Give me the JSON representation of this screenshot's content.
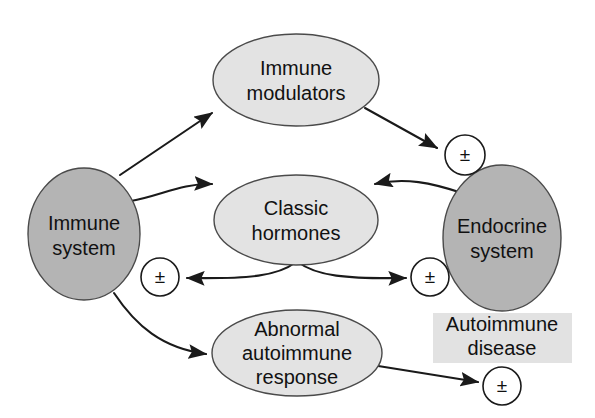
{
  "figure": {
    "type": "flow-diagram"
  },
  "colors": {
    "node_dark_gray": "#b4b4b4",
    "node_light_gray": "#e3e3e3",
    "box_gray": "#e2e2e2",
    "outline": "#4a4a4a",
    "arrow": "#1a1a1a",
    "text": "#111111",
    "background": "#ffffff"
  },
  "nodes": {
    "immune_system": {
      "label_line1": "Immune",
      "label_line2": "system",
      "shape": "ellipse",
      "fill": "#b4b4b4"
    },
    "immune_modulators": {
      "label_line1": "Immune",
      "label_line2": "modulators",
      "shape": "ellipse",
      "fill": "#e3e3e3"
    },
    "classic_hormones": {
      "label_line1": "Classic",
      "label_line2": "hormones",
      "shape": "ellipse",
      "fill": "#e3e3e3"
    },
    "endocrine_system": {
      "label_line1": "Endocrine",
      "label_line2": "system",
      "shape": "ellipse",
      "fill": "#b4b4b4"
    },
    "abnormal_autoimmune_response": {
      "label_line1": "Abnormal",
      "label_line2": "autoimmune",
      "label_line3": "response",
      "shape": "ellipse",
      "fill": "#e3e3e3"
    },
    "autoimmune_disease": {
      "label_line1": "Autoimmune",
      "label_line2": "disease",
      "shape": "rectangle",
      "fill": "#e2e2e2"
    }
  },
  "sign_markers": {
    "top_right": "±",
    "left_middle": "±",
    "right_middle": "±",
    "bottom_right": "±"
  },
  "edges": [
    {
      "id": "immune-system-to-immune-modulators",
      "from": "immune_system",
      "to": "immune_modulators",
      "style": "straight",
      "arrowheads": "end"
    },
    {
      "id": "immune-system-to-classic-hormones",
      "from": "immune_system",
      "to": "classic_hormones",
      "style": "curved",
      "arrowheads": "end"
    },
    {
      "id": "immune-modulators-to-sign-top-right",
      "from": "immune_modulators",
      "to": "sign_top_right",
      "style": "straight",
      "arrowheads": "end"
    },
    {
      "id": "endocrine-system-to-classic-hormones",
      "from": "endocrine_system",
      "to": "classic_hormones",
      "style": "curved",
      "arrowheads": "end"
    },
    {
      "id": "classic-hormones-to-sign-left-middle",
      "from": "classic_hormones",
      "to": "sign_left_middle",
      "style": "curved-fork",
      "arrowheads": "end"
    },
    {
      "id": "classic-hormones-to-sign-right-middle",
      "from": "classic_hormones",
      "to": "sign_right_middle",
      "style": "curved-fork",
      "arrowheads": "end"
    },
    {
      "id": "immune-system-to-abnormal-autoimmune-response",
      "from": "immune_system",
      "to": "abnormal_autoimmune_response",
      "style": "curved",
      "arrowheads": "end"
    },
    {
      "id": "abnormal-autoimmune-response-to-sign-bottom-right",
      "from": "abnormal_autoimmune_response",
      "to": "sign_bottom_right",
      "style": "straight",
      "arrowheads": "end"
    }
  ]
}
